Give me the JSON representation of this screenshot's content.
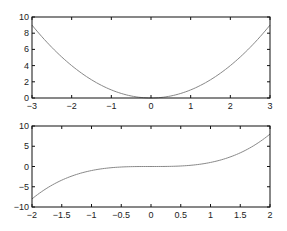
{
  "chart_data": [
    {
      "type": "line",
      "title": "",
      "xlabel": "",
      "ylabel": "",
      "xlim": [
        -3,
        3
      ],
      "ylim": [
        0,
        10
      ],
      "xticks": [
        -3,
        -2,
        -1,
        0,
        1,
        2,
        3
      ],
      "yticks": [
        0,
        2,
        4,
        6,
        8,
        10
      ],
      "grid": false,
      "legend": null,
      "series": [
        {
          "name": "y = x^2",
          "color": "#888888",
          "x": [
            -3,
            -2.5,
            -2,
            -1.5,
            -1,
            -0.5,
            0,
            0.5,
            1,
            1.5,
            2,
            2.5,
            3
          ],
          "y": [
            9,
            6.25,
            4,
            2.25,
            1,
            0.25,
            0,
            0.25,
            1,
            2.25,
            4,
            6.25,
            9
          ]
        }
      ]
    },
    {
      "type": "line",
      "title": "",
      "xlabel": "",
      "ylabel": "",
      "xlim": [
        -2,
        2
      ],
      "ylim": [
        -10,
        10
      ],
      "xticks": [
        -2,
        -1.5,
        -1,
        -0.5,
        0,
        0.5,
        1,
        1.5,
        2
      ],
      "yticks": [
        -10,
        -5,
        0,
        5,
        10
      ],
      "grid": false,
      "legend": null,
      "series": [
        {
          "name": "y = x^3",
          "color": "#888888",
          "x": [
            -2,
            -1.75,
            -1.5,
            -1.25,
            -1,
            -0.75,
            -0.5,
            -0.25,
            0,
            0.25,
            0.5,
            0.75,
            1,
            1.25,
            1.5,
            1.75,
            2
          ],
          "y": [
            -8,
            -5.36,
            -3.375,
            -1.95,
            -1,
            -0.42,
            -0.125,
            -0.016,
            0,
            0.016,
            0.125,
            0.42,
            1,
            1.95,
            3.375,
            5.36,
            8
          ]
        }
      ]
    }
  ],
  "layout": {
    "plots": [
      {
        "left": 32,
        "top": 17,
        "right": 270,
        "bottom": 98
      },
      {
        "left": 32,
        "top": 126,
        "right": 270,
        "bottom": 207
      }
    ]
  }
}
